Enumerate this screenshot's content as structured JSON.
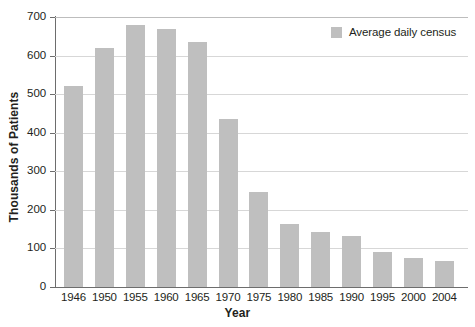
{
  "chart_data": {
    "type": "bar",
    "title": "",
    "subtitle": "",
    "xlabel": "Year",
    "ylabel": "Thousands of Patients",
    "categories": [
      "1946",
      "1950",
      "1955",
      "1960",
      "1965",
      "1970",
      "1975",
      "1980",
      "1985",
      "1990",
      "1995",
      "2000",
      "2004"
    ],
    "values": [
      520,
      620,
      680,
      668,
      635,
      435,
      247,
      163,
      143,
      132,
      90,
      76,
      67
    ],
    "series": [
      {
        "name": "Average daily census",
        "values": [
          520,
          620,
          680,
          668,
          635,
          435,
          247,
          163,
          143,
          132,
          90,
          76,
          67
        ]
      }
    ],
    "ylim": [
      0,
      700
    ],
    "ytick_step": 100,
    "yticks": [
      "700",
      "600",
      "500",
      "400",
      "300",
      "200",
      "100",
      "0"
    ],
    "grid": "horizontal",
    "legend_position": "top-right",
    "bar_color": "#bfbfbf",
    "gridline_color": "#d7d7d7",
    "axis_color": "#6d6d6d"
  },
  "legend": {
    "entries": [
      {
        "label": "Average daily census",
        "color": "#bfbfbf"
      }
    ]
  },
  "caption": {
    "text": ""
  }
}
